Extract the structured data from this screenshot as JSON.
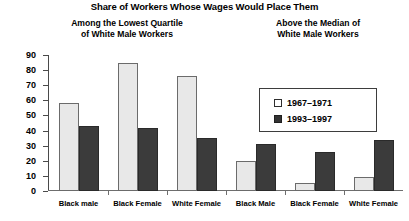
{
  "chart_data": {
    "type": "bar",
    "title": "Share of Workers Whose Wages Would Place Them",
    "subtitle_left": [
      "Among the Lowest Quartile",
      "of White Male Workers"
    ],
    "subtitle_right": [
      "Above the Median of",
      "White Male Workers"
    ],
    "categories": [
      "Black male",
      "Black Female",
      "White Female",
      "Black Male",
      "Black Female",
      "White Female"
    ],
    "series": [
      {
        "name": "1967–1971",
        "values": [
          58,
          85,
          76,
          20,
          5,
          9
        ],
        "color": "#e8e8e8"
      },
      {
        "name": "1993–1997",
        "values": [
          43,
          42,
          35,
          31,
          26,
          34
        ],
        "color": "#3b3b3b"
      }
    ],
    "xlabel": "",
    "ylabel": "",
    "ylim": [
      0,
      90
    ],
    "yticks": [
      90,
      80,
      70,
      60,
      50,
      40,
      30,
      20,
      10,
      0
    ],
    "grid": false,
    "legend_position": "inside-top-right"
  },
  "legend": {
    "entries": [
      {
        "label": "1967–1971",
        "swatch": "light"
      },
      {
        "label": "1993–1997",
        "swatch": "dark"
      }
    ]
  }
}
